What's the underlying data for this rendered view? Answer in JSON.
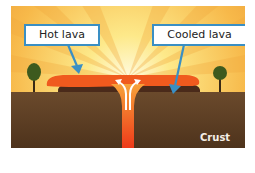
{
  "diagram": {
    "labels": {
      "hot_lava": "Hot lava",
      "cooled_lava": "Cooled lava",
      "crust": "Crust"
    },
    "colors": {
      "sky_light": "#fde98a",
      "sky_ray": "#f7b94a",
      "sky_edge": "#f0a53c",
      "hot_lava": "#f05a1e",
      "cooled_lava": "#4a2a1a",
      "crust": "#5c3e24",
      "magma_channel": "#f04a1c",
      "arrow_blue": "#3a8fc4",
      "tree": "#3d5a1e"
    }
  }
}
